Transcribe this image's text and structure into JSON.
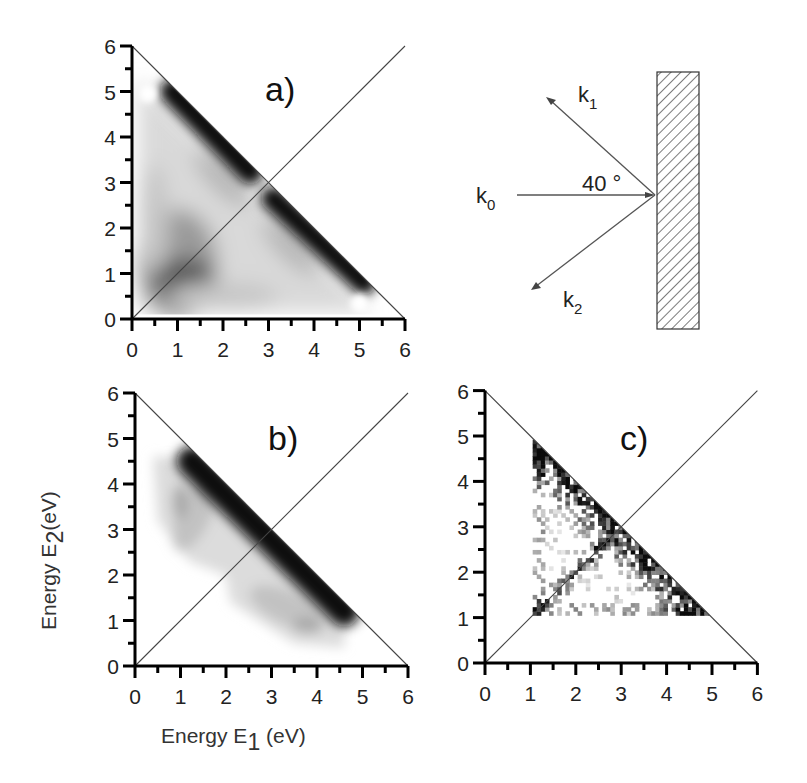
{
  "chart_data": [
    {
      "id": "a",
      "type": "heatmap",
      "panel_label": "a)",
      "xlabel": "",
      "ylabel": "",
      "xlim": [
        0,
        6
      ],
      "ylim": [
        0,
        6
      ],
      "xticks": [
        "0",
        "1",
        "2",
        "3",
        "4",
        "5",
        "6"
      ],
      "yticks": [
        "0",
        "1",
        "2",
        "3",
        "4",
        "5",
        "6"
      ],
      "minor_ticks": true,
      "guide_lines": [
        {
          "name": "E1+E2=6",
          "from": [
            0,
            6
          ],
          "to": [
            6,
            0
          ]
        },
        {
          "name": "E1=E2",
          "from": [
            0,
            0
          ],
          "to": [
            6,
            6
          ]
        }
      ],
      "colormap": "grayscale (white=low, black=high)",
      "features": [
        {
          "description": "dark band along E1+E2=6 edge",
          "from": [
            0.8,
            5.1
          ],
          "to": [
            5.2,
            0.8
          ],
          "intensity": "high"
        },
        {
          "description": "dark blob near low energies",
          "center": [
            1.0,
            0.9
          ],
          "intensity": "medium-high"
        },
        {
          "description": "white spots (low) near corners",
          "points": [
            [
              0.3,
              5.0
            ],
            [
              5.0,
              0.3
            ]
          ]
        }
      ]
    },
    {
      "id": "b",
      "type": "heatmap",
      "panel_label": "b)",
      "xlabel": "Energy E1 (eV)",
      "ylabel": "Energy E2 (eV)",
      "xlim": [
        0,
        6
      ],
      "ylim": [
        0,
        6
      ],
      "xticks": [
        "0",
        "1",
        "2",
        "3",
        "4",
        "5",
        "6"
      ],
      "yticks": [
        "0",
        "1",
        "2",
        "3",
        "4",
        "5",
        "6"
      ],
      "minor_ticks": true,
      "guide_lines": [
        {
          "name": "E1+E2=6",
          "from": [
            0,
            6
          ],
          "to": [
            6,
            0
          ]
        },
        {
          "name": "E1=E2",
          "from": [
            0,
            0
          ],
          "to": [
            6,
            6
          ]
        }
      ],
      "colormap": "grayscale (white=low, black=high)",
      "features": [
        {
          "description": "dark band just below E1+E2=6 edge",
          "from": [
            1.1,
            4.7
          ],
          "to": [
            4.8,
            1.1
          ],
          "intensity": "high"
        },
        {
          "description": "light gray lobes off the band",
          "centers": [
            [
              1.0,
              3.6
            ],
            [
              3.6,
              1.0
            ]
          ],
          "intensity": "low"
        }
      ]
    },
    {
      "id": "c",
      "type": "heatmap",
      "panel_label": "c)",
      "xlabel": "",
      "ylabel": "",
      "xlim": [
        0,
        6
      ],
      "ylim": [
        0,
        6
      ],
      "xticks": [
        "0",
        "1",
        "2",
        "3",
        "4",
        "5",
        "6"
      ],
      "yticks": [
        "0",
        "1",
        "2",
        "3",
        "4",
        "5",
        "6"
      ],
      "minor_ticks": true,
      "guide_lines": [
        {
          "name": "E1+E2=6",
          "from": [
            0,
            6
          ],
          "to": [
            6,
            0
          ]
        },
        {
          "name": "E1=E2",
          "from": [
            0,
            0
          ],
          "to": [
            6,
            6
          ]
        }
      ],
      "colormap": "grayscale, noisy pixelated data",
      "data_region": {
        "E1_min": 1.05,
        "E2_min": 1.05,
        "E1_max": 5.0,
        "E2_max": 4.8
      },
      "features": [
        {
          "description": "dense region near E1+E2=6 around (3,3) to (4,2)",
          "intensity": "high"
        },
        {
          "description": "dense strip along diagonal E1=E2 from (1.1,1.1) to (2.6,2.6)",
          "intensity": "high"
        }
      ]
    }
  ],
  "diagram": {
    "incident_label": "k",
    "incident_sub": "0",
    "out1_label": "k",
    "out1_sub": "1",
    "out2_label": "k",
    "out2_sub": "2",
    "angle_label": "40 °"
  },
  "axis_titles": {
    "x_main": "Energy E",
    "x_sub": "1",
    "x_unit": " (eV)",
    "y_main": "Energy  E",
    "y_sub": "2",
    "y_unit": "(eV)"
  }
}
